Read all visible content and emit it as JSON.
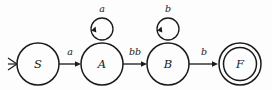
{
  "diagram": {
    "type": "finite-state-automaton",
    "title": "",
    "background_color": "#fdfdfd",
    "stroke_color": "#1a1a1a",
    "states": [
      {
        "id": "S",
        "label": "S",
        "kind": "start",
        "accepting": false,
        "cx": 38,
        "cy": 64,
        "r": 21
      },
      {
        "id": "A",
        "label": "A",
        "kind": "normal",
        "accepting": false,
        "cx": 102,
        "cy": 64,
        "r": 21
      },
      {
        "id": "B",
        "label": "B",
        "kind": "normal",
        "accepting": false,
        "cx": 168,
        "cy": 64,
        "r": 21
      },
      {
        "id": "F",
        "label": "F",
        "kind": "accept",
        "accepting": true,
        "cx": 240,
        "cy": 64,
        "r": 21,
        "inner_r": 16.5
      }
    ],
    "transitions": [
      {
        "from": "S",
        "to": "A",
        "label": "a",
        "label_x": 70,
        "label_y": 52,
        "kind": "straight"
      },
      {
        "from": "A",
        "to": "B",
        "label": "bb",
        "label_x": 135,
        "label_y": 52,
        "kind": "straight"
      },
      {
        "from": "B",
        "to": "F",
        "label": "b",
        "label_x": 204,
        "label_y": 52,
        "kind": "straight"
      },
      {
        "from": "A",
        "to": "A",
        "label": "a",
        "label_x": 102,
        "label_y": 9,
        "kind": "self-loop",
        "loop_cx": 102,
        "loop_cy": 29,
        "loop_r": 11
      },
      {
        "from": "B",
        "to": "B",
        "label": "b",
        "label_x": 168,
        "label_y": 9,
        "kind": "self-loop",
        "loop_cx": 168,
        "loop_cy": 29,
        "loop_r": 11
      }
    ],
    "start_marker": {
      "target": "S",
      "shape": "chevron",
      "x": 8,
      "y": 64
    }
  }
}
